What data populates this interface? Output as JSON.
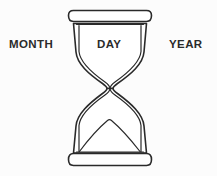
{
  "illustration": {
    "title": "Hourglass with time unit labels",
    "style": "line-art-outline",
    "stroke_color": "#2a2a2a",
    "fill_color": "#ffffff",
    "background_color": "#fcfcfc",
    "parts": {
      "top_cap": "hourglass-top-cap",
      "upper_bulb": "hourglass-upper-bulb",
      "waist": "hourglass-neck",
      "lower_bulb": "hourglass-lower-bulb",
      "sand_mound": "hourglass-sand-pile",
      "bottom_cap": "hourglass-bottom-cap"
    }
  },
  "labels": {
    "left": "MONTH",
    "center": "DAY",
    "right": "YEAR"
  }
}
